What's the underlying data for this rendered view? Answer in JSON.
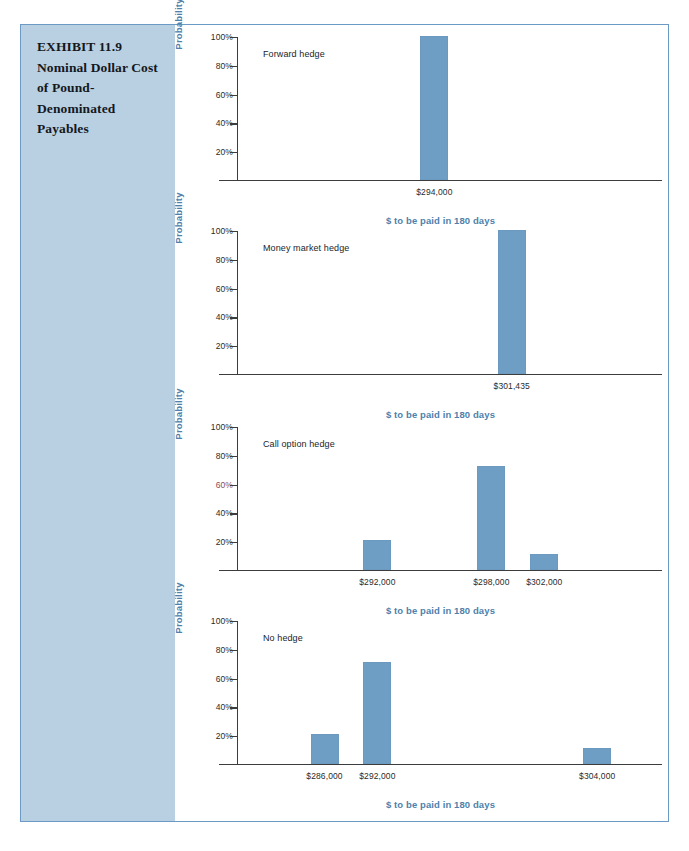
{
  "exhibit": {
    "caption_number": "EXHIBIT 11.9",
    "caption_title": "Nominal Dollar Cost of Pound-Denominated Payables",
    "accent_color": "#6b9ac4",
    "panel_color": "#b9d0e3",
    "bar_color": "#6f9ec4",
    "axis_label_color": "#4f7fab"
  },
  "axis": {
    "y_title": "Probability",
    "x_title": "$ to be paid in 180 days",
    "y_ticks": [
      "100%",
      "80%",
      "60%",
      "40%",
      "20%"
    ]
  },
  "chart_data": [
    {
      "type": "bar",
      "title": "Forward hedge",
      "xlabel": "$ to be paid in 180 days",
      "ylabel": "Probability",
      "ylim": [
        0,
        100
      ],
      "yticks": [
        20,
        40,
        60,
        80,
        100
      ],
      "grid": false,
      "legend": "none",
      "categories": [
        "$294,000"
      ],
      "values": [
        100
      ],
      "positions": [
        0.485
      ]
    },
    {
      "type": "bar",
      "title": "Money market hedge",
      "xlabel": "$ to be paid in 180 days",
      "ylabel": "Probability",
      "ylim": [
        0,
        100
      ],
      "yticks": [
        20,
        40,
        60,
        80,
        100
      ],
      "grid": false,
      "legend": "none",
      "categories": [
        "$301,435"
      ],
      "values": [
        100
      ],
      "positions": [
        0.675
      ]
    },
    {
      "type": "bar",
      "title": "Call option hedge",
      "xlabel": "$ to be paid in 180 days",
      "ylabel": "Probability",
      "ylim": [
        0,
        100
      ],
      "yticks": [
        20,
        40,
        60,
        80,
        100
      ],
      "grid": false,
      "legend": "none",
      "categories": [
        "$292,000",
        "$298,000",
        "$302,000"
      ],
      "values": [
        21,
        72,
        11
      ],
      "positions": [
        0.345,
        0.625,
        0.755
      ]
    },
    {
      "type": "bar",
      "title": "No hedge",
      "xlabel": "$ to be paid in 180 days",
      "ylabel": "Probability",
      "ylim": [
        0,
        100
      ],
      "yticks": [
        20,
        40,
        60,
        80,
        100
      ],
      "grid": false,
      "legend": "none",
      "categories": [
        "$286,000",
        "$292,000",
        "$304,000"
      ],
      "values": [
        21,
        71,
        11
      ],
      "positions": [
        0.215,
        0.345,
        0.885
      ]
    }
  ]
}
